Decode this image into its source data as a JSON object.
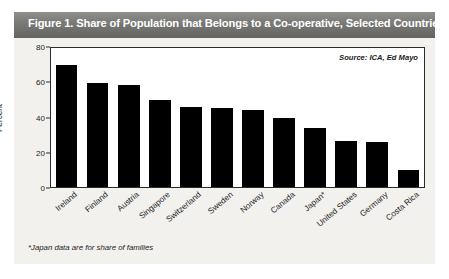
{
  "figure": {
    "title": "Figure 1.  Share of Population that Belongs to a Co-operative, Selected Countries",
    "source_note": "Source: ICA, Ed Mayo",
    "footnote": "*Japan data are for share of families",
    "header_color": "#7a7a77",
    "bar_color": "#000000",
    "panel_color": "#f2f1ee"
  },
  "chart_data": {
    "type": "bar",
    "title": "Figure 1.  Share of Population that Belongs to a Co-operative, Selected Countries",
    "xlabel": "",
    "ylabel": "Percent",
    "ylim": [
      0,
      80
    ],
    "yticks": [
      0,
      20,
      40,
      60,
      80
    ],
    "grid": false,
    "legend": null,
    "annotations": [
      "Source: ICA, Ed Mayo",
      "*Japan data are for share of families"
    ],
    "categories": [
      "Ireland",
      "Finland",
      "Austria",
      "Singapore",
      "Switzerland",
      "Sweden",
      "Norway",
      "Canada",
      "Japan*",
      "United States",
      "Germany",
      "Costa Rica"
    ],
    "values": [
      70,
      60,
      59,
      50,
      46,
      45.5,
      44.5,
      40,
      34,
      26.5,
      26,
      10
    ]
  }
}
